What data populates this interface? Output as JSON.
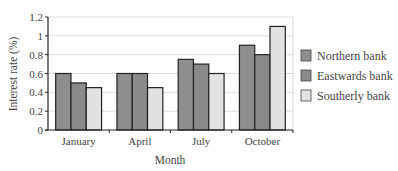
{
  "chart_data": {
    "type": "bar",
    "title": "",
    "xlabel": "Month",
    "ylabel": "Interest rate (%)",
    "ylim": [
      0,
      1.2
    ],
    "yticks": [
      "0",
      "0.2",
      "0.4",
      "0.6",
      "0.8",
      "1",
      "1.2"
    ],
    "grid": true,
    "legend_position": "right",
    "categories": [
      "January",
      "April",
      "July",
      "October"
    ],
    "series": [
      {
        "name": "Northern bank",
        "values": [
          0.6,
          0.6,
          0.75,
          0.9
        ],
        "color": "#8e8e8e"
      },
      {
        "name": "Eastwards bank",
        "values": [
          0.5,
          0.6,
          0.7,
          0.8
        ],
        "color": "#8a8a8a"
      },
      {
        "name": "Southerly bank",
        "values": [
          0.45,
          0.45,
          0.6,
          1.1
        ],
        "color": "#e2e2e2"
      }
    ]
  }
}
